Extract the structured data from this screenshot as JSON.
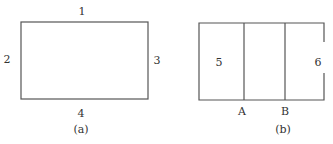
{
  "figure_a": {
    "edge_labels": {
      "top": "1",
      "left": "2",
      "right": "3",
      "bottom": "4"
    },
    "caption": "(a)"
  },
  "figure_b": {
    "region_labels": {
      "left": "5",
      "right": "6"
    },
    "point_labels": {
      "a": "A",
      "b": "B"
    },
    "caption": "(b)"
  },
  "colors": {
    "line": "#555555",
    "text": "#333333"
  }
}
